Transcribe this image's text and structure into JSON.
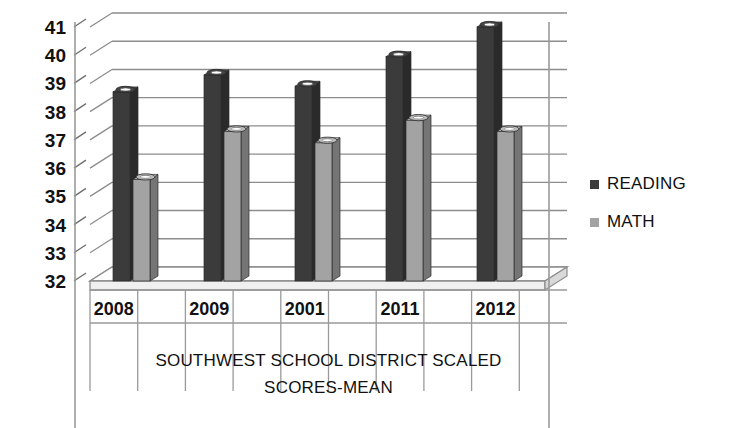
{
  "chart_data": {
    "type": "bar",
    "title_line1": "SOUTHWEST SCHOOL DISTRICT SCALED",
    "title_line2": "SCORES-MEAN",
    "xlabel": "",
    "ylabel": "",
    "categories": [
      "2008",
      "2009",
      "2001",
      "2011",
      "2012"
    ],
    "series": [
      {
        "name": "READING",
        "color": "#3b3b3b",
        "values": [
          38.7,
          39.3,
          38.9,
          39.95,
          41.0
        ]
      },
      {
        "name": "MATH",
        "color": "#a3a3a3",
        "values": [
          35.6,
          37.3,
          36.9,
          37.7,
          37.3
        ]
      }
    ],
    "ylim": [
      32,
      41
    ],
    "yticks": [
      "41",
      "40",
      "39",
      "38",
      "37",
      "36",
      "35",
      "34",
      "33",
      "32"
    ],
    "grid": true,
    "legend_position": "right",
    "style": "3d-column-grayscale"
  },
  "legend": {
    "items": [
      {
        "label": "READING",
        "swatch": "#3b3b3b"
      },
      {
        "label": "MATH",
        "swatch": "#a3a3a3"
      }
    ]
  },
  "colors": {
    "reading": "#3b3b3b",
    "math": "#a3a3a3",
    "gridline": "#8d8d8d",
    "axis": "#6f6f6f",
    "background": "#ffffff"
  }
}
